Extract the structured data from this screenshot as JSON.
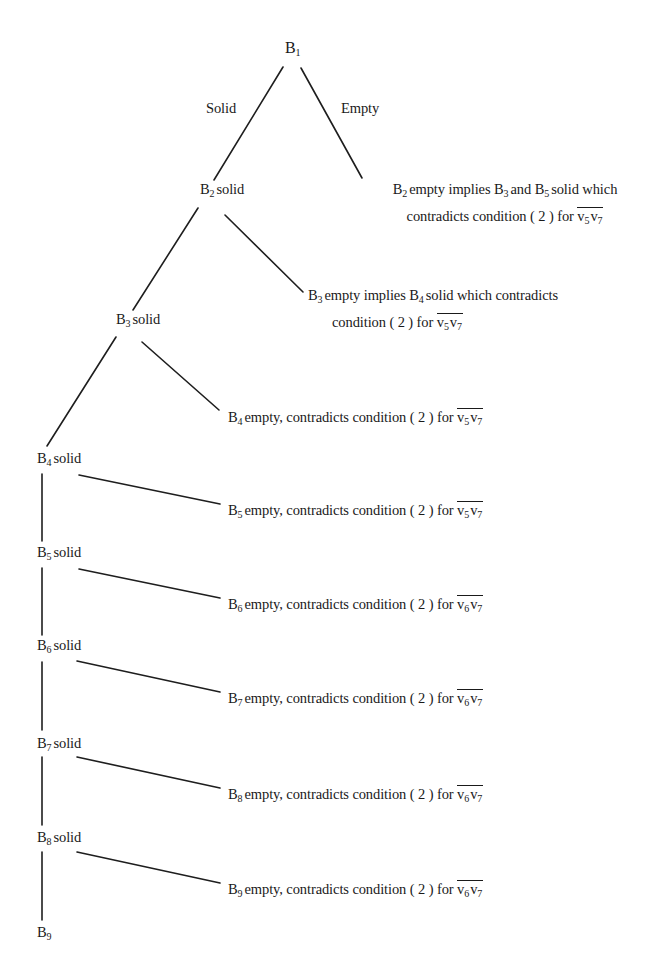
{
  "diagram": {
    "root": {
      "var": "B",
      "idx": "1"
    },
    "branch_labels": {
      "left": "Solid",
      "right": "Empty"
    },
    "solid_word": "solid",
    "empty_word": "empty",
    "nodes": [
      {
        "id": "B2-solid",
        "var": "B",
        "idx": "2",
        "state": "solid"
      },
      {
        "id": "B3-solid",
        "var": "B",
        "idx": "3",
        "state": "solid"
      },
      {
        "id": "B4-solid",
        "var": "B",
        "idx": "4",
        "state": "solid"
      },
      {
        "id": "B5-solid",
        "var": "B",
        "idx": "5",
        "state": "solid"
      },
      {
        "id": "B6-solid",
        "var": "B",
        "idx": "6",
        "state": "solid"
      },
      {
        "id": "B7-solid",
        "var": "B",
        "idx": "7",
        "state": "solid"
      },
      {
        "id": "B8-solid",
        "var": "B",
        "idx": "8",
        "state": "solid"
      },
      {
        "id": "B9",
        "var": "B",
        "idx": "9",
        "state": ""
      }
    ],
    "contradictions": [
      {
        "id": "B2-empty",
        "line1": {
          "pre": "B",
          "pre_idx": "2",
          "t1": "empty implies ",
          "v1": "B",
          "v1_idx": "3",
          "t2": "and ",
          "v2": "B",
          "v2_idx": "5",
          "t3": "solid which"
        },
        "line2": {
          "text": "contradicts condition ( 2 ) for ",
          "edge_a": "v",
          "edge_a_idx": "5",
          "edge_b": "v",
          "edge_b_idx": "7"
        }
      },
      {
        "id": "B3-empty",
        "line1": {
          "pre": "B",
          "pre_idx": "3",
          "t1": "empty implies ",
          "v1": "B",
          "v1_idx": "4",
          "t2": "solid which contradicts"
        },
        "line2": {
          "text": "condition ( 2 ) for ",
          "edge_a": "v",
          "edge_a_idx": "5",
          "edge_b": "v",
          "edge_b_idx": "7"
        }
      },
      {
        "id": "B4-empty",
        "var": "B",
        "idx": "4",
        "text": "empty, contradicts condition ( 2 ) for ",
        "edge_a": "v",
        "edge_a_idx": "5",
        "edge_b": "v",
        "edge_b_idx": "7"
      },
      {
        "id": "B5-empty",
        "var": "B",
        "idx": "5",
        "text": "empty, contradicts condition ( 2 ) for ",
        "edge_a": "v",
        "edge_a_idx": "5",
        "edge_b": "v",
        "edge_b_idx": "7"
      },
      {
        "id": "B6-empty",
        "var": "B",
        "idx": "6",
        "text": "empty, contradicts condition ( 2 ) for ",
        "edge_a": "v",
        "edge_a_idx": "6",
        "edge_b": "v",
        "edge_b_idx": "7"
      },
      {
        "id": "B7-empty",
        "var": "B",
        "idx": "7",
        "text": "empty, contradicts condition ( 2 ) for ",
        "edge_a": "v",
        "edge_a_idx": "6",
        "edge_b": "v",
        "edge_b_idx": "7"
      },
      {
        "id": "B8-empty",
        "var": "B",
        "idx": "8",
        "text": "empty, contradicts condition ( 2 ) for ",
        "edge_a": "v",
        "edge_a_idx": "6",
        "edge_b": "v",
        "edge_b_idx": "7"
      },
      {
        "id": "B9-empty",
        "var": "B",
        "idx": "9",
        "text": "empty, contradicts condition ( 2 ) for ",
        "edge_a": "v",
        "edge_a_idx": "6",
        "edge_b": "v",
        "edge_b_idx": "7"
      }
    ]
  },
  "colors": {
    "ink": "#1a1a1a",
    "paper": "#ffffff"
  }
}
